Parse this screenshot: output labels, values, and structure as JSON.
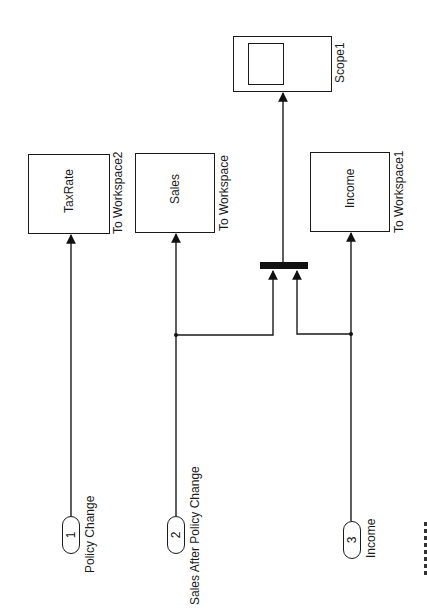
{
  "diagram": {
    "type": "simulink-block-diagram",
    "orientation": "rotated-90-ccw",
    "colors": {
      "line": "#1a1a1a",
      "background": "#ffffff"
    },
    "inports": [
      {
        "number": "1",
        "label": "Policy Change"
      },
      {
        "number": "2",
        "label": "Sales After Policy Change"
      },
      {
        "number": "3",
        "label": "Income"
      }
    ],
    "to_workspace_blocks": [
      {
        "variable": "TaxRate",
        "label": "To Workspace2"
      },
      {
        "variable": "Sales",
        "label": "To Workspace"
      },
      {
        "variable": "Income",
        "label": "To Workspace1"
      }
    ],
    "mux": {
      "inputs": 2
    },
    "scope": {
      "label": "Scope1"
    },
    "connections": [
      "Inport 1 (Policy Change) -> To Workspace2 (TaxRate)",
      "Inport 2 (Sales After Policy Change) -> To Workspace (Sales)",
      "Inport 2 (Sales After Policy Change) -> Mux input 1",
      "Inport 3 (Income) -> To Workspace1 (Income)",
      "Inport 3 (Income) -> Mux input 2",
      "Mux -> Scope1"
    ]
  }
}
